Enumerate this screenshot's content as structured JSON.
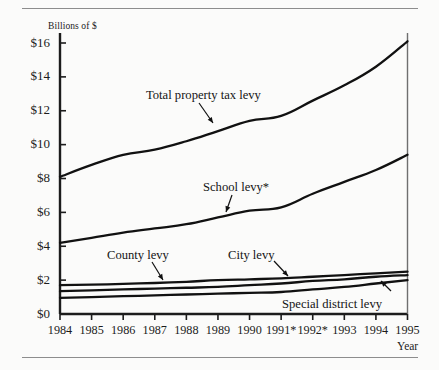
{
  "figure": {
    "y_axis_title": "Billions of $",
    "x_axis_title": "Year"
  },
  "y_ticks": [
    {
      "label": "$16",
      "value": 16
    },
    {
      "label": "$14",
      "value": 14
    },
    {
      "label": "$12",
      "value": 12
    },
    {
      "label": "$10",
      "value": 10
    },
    {
      "label": "$8",
      "value": 8
    },
    {
      "label": "$6",
      "value": 6
    },
    {
      "label": "$4",
      "value": 4
    },
    {
      "label": "$2",
      "value": 2
    },
    {
      "label": "$0",
      "value": 0
    }
  ],
  "x_ticks": [
    {
      "label": "1984",
      "value": 1984
    },
    {
      "label": "1985",
      "value": 1985
    },
    {
      "label": "1986",
      "value": 1986
    },
    {
      "label": "1987",
      "value": 1987
    },
    {
      "label": "1988",
      "value": 1988
    },
    {
      "label": "1989",
      "value": 1989
    },
    {
      "label": "1990",
      "value": 1990
    },
    {
      "label": "1991*",
      "value": 1991
    },
    {
      "label": "1992*",
      "value": 1992
    },
    {
      "label": "1993",
      "value": 1993
    },
    {
      "label": "1994",
      "value": 1994
    },
    {
      "label": "1995",
      "value": 1995
    }
  ],
  "annotations": [
    {
      "name": "total-property-tax-levy",
      "text": "Total property tax levy"
    },
    {
      "name": "school-levy",
      "text": "School levy*"
    },
    {
      "name": "county-levy",
      "text": "County levy"
    },
    {
      "name": "city-levy",
      "text": "City levy"
    },
    {
      "name": "special-district-levy",
      "text": "Special district levy"
    }
  ],
  "chart_data": {
    "type": "line",
    "title": "",
    "xlabel": "Year",
    "ylabel": "Billions of $",
    "xlim": [
      1984,
      1995
    ],
    "ylim": [
      0,
      17
    ],
    "grid": false,
    "legend": "inline-annotations",
    "x": [
      1984,
      1985,
      1986,
      1987,
      1988,
      1989,
      1990,
      1991,
      1992,
      1993,
      1994,
      1995
    ],
    "tick_labels": [
      "1984",
      "1985",
      "1986",
      "1987",
      "1988",
      "1989",
      "1990",
      "1991*",
      "1992*",
      "1993",
      "1994",
      "1995"
    ],
    "series": [
      {
        "name": "Total property tax levy",
        "values": [
          8.1,
          8.8,
          9.4,
          9.7,
          10.2,
          10.8,
          11.4,
          11.7,
          12.6,
          13.5,
          14.6,
          16.1
        ]
      },
      {
        "name": "School levy*",
        "values": [
          4.2,
          4.5,
          4.8,
          5.05,
          5.3,
          5.7,
          6.1,
          6.3,
          7.1,
          7.8,
          8.5,
          9.4
        ]
      },
      {
        "name": "County levy",
        "values": [
          1.7,
          1.73,
          1.78,
          1.83,
          1.9,
          2.0,
          2.05,
          2.1,
          2.2,
          2.3,
          2.4,
          2.5
        ]
      },
      {
        "name": "City levy",
        "values": [
          1.35,
          1.4,
          1.45,
          1.5,
          1.55,
          1.6,
          1.7,
          1.8,
          1.95,
          2.05,
          2.2,
          2.3
        ]
      },
      {
        "name": "Special district levy",
        "values": [
          0.95,
          1.0,
          1.05,
          1.1,
          1.15,
          1.2,
          1.25,
          1.3,
          1.45,
          1.6,
          1.8,
          2.0
        ]
      }
    ]
  }
}
